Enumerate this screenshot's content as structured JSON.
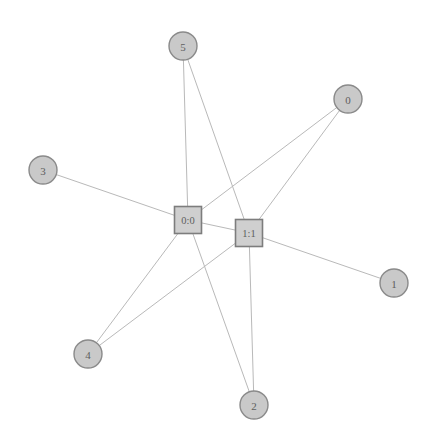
{
  "diagram": {
    "type": "node-link-graph",
    "background_color": "#ffffff",
    "edge_color": "#b9b9b9",
    "circle_fill": "#c9c9c9",
    "circle_stroke": "#8a8a8a",
    "square_fill": "#cfcfcf",
    "square_stroke": "#7d7d7d",
    "label_color": "#5e5e5e",
    "width": 429,
    "height": 446
  },
  "nodes": [
    {
      "id": "5",
      "label": "5",
      "shape": "circle",
      "x": 183,
      "y": 46,
      "r": 14
    },
    {
      "id": "0",
      "label": "0",
      "shape": "circle",
      "x": 348,
      "y": 99,
      "r": 14
    },
    {
      "id": "3",
      "label": "3",
      "shape": "circle",
      "x": 43,
      "y": 170,
      "r": 14
    },
    {
      "id": "1",
      "label": "1",
      "shape": "circle",
      "x": 394,
      "y": 283,
      "r": 14
    },
    {
      "id": "4",
      "label": "4",
      "shape": "circle",
      "x": 88,
      "y": 354,
      "r": 14
    },
    {
      "id": "2",
      "label": "2",
      "shape": "circle",
      "x": 254,
      "y": 405,
      "r": 14
    },
    {
      "id": "0:0",
      "label": "0:0",
      "shape": "square",
      "x": 188,
      "y": 220,
      "size": 27
    },
    {
      "id": "1:1",
      "label": "1:1",
      "shape": "square",
      "x": 249,
      "y": 233,
      "size": 27
    }
  ],
  "edges": [
    {
      "source": "0:0",
      "target": "3"
    },
    {
      "source": "0:0",
      "target": "5"
    },
    {
      "source": "0:0",
      "target": "4"
    },
    {
      "source": "0:0",
      "target": "2"
    },
    {
      "source": "0:0",
      "target": "0"
    },
    {
      "source": "0:0",
      "target": "1:1"
    },
    {
      "source": "1:1",
      "target": "5"
    },
    {
      "source": "1:1",
      "target": "0"
    },
    {
      "source": "1:1",
      "target": "4"
    },
    {
      "source": "1:1",
      "target": "2"
    },
    {
      "source": "1:1",
      "target": "1"
    }
  ]
}
